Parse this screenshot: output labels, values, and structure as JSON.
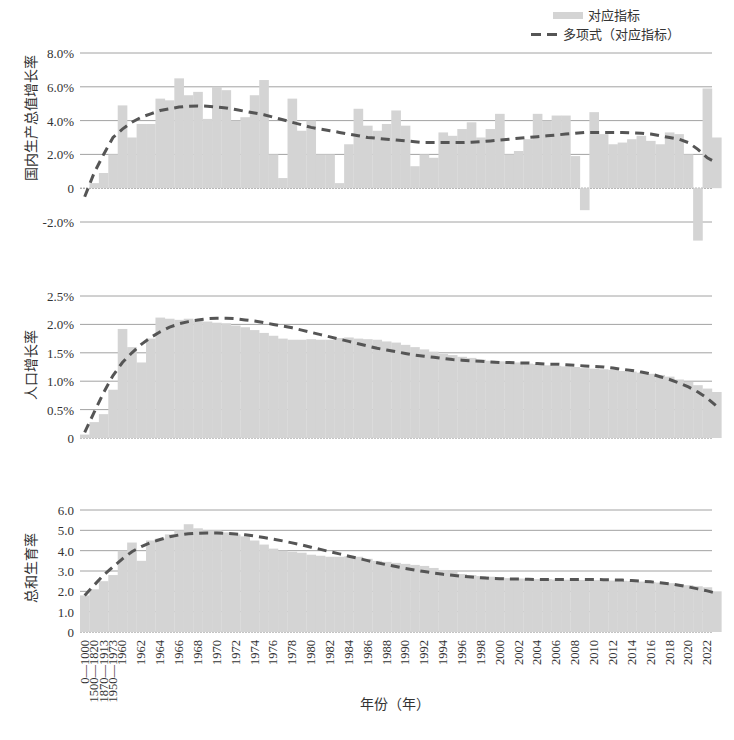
{
  "legend": {
    "bar_label": "对应指标",
    "trend_label": "多项式（对应指标）"
  },
  "x_axis": {
    "title": "年份（年）",
    "tick_labels": [
      "0—1000",
      "1500—1820",
      "1870—1913",
      "1950—1973",
      "1960",
      "1962",
      "1964",
      "1966",
      "1968",
      "1970",
      "1972",
      "1974",
      "1976",
      "1978",
      "1980",
      "1982",
      "1984",
      "1986",
      "1988",
      "1990",
      "1992",
      "1994",
      "1996",
      "1998",
      "2000",
      "2002",
      "2004",
      "2006",
      "2008",
      "2010",
      "2012",
      "2014",
      "2016",
      "2018",
      "2020",
      "2022"
    ]
  },
  "colors": {
    "bar": "#d4d4d4",
    "trend": "#555555",
    "grid": "#8a8a8a",
    "text": "#333333"
  },
  "chart_data": [
    {
      "type": "bar",
      "title": "",
      "ylabel": "国内生产总值增长率",
      "xlabel": "年份（年）",
      "ylim": [
        -2.0,
        8.0
      ],
      "yticks": [
        -2.0,
        0,
        2.0,
        4.0,
        6.0,
        8.0
      ],
      "ytick_labels": [
        "-2.0%",
        "0",
        "2.0%",
        "4.0%",
        "6.0%",
        "8.0%"
      ],
      "grid": true,
      "legend_position": "top-right",
      "categories": [
        "0—1000",
        "1500—1820",
        "1870—1913",
        "1950—1973",
        "1960",
        "1961",
        "1962",
        "1963",
        "1964",
        "1965",
        "1966",
        "1967",
        "1968",
        "1969",
        "1970",
        "1971",
        "1972",
        "1973",
        "1974",
        "1975",
        "1976",
        "1977",
        "1978",
        "1979",
        "1980",
        "1981",
        "1982",
        "1983",
        "1984",
        "1985",
        "1986",
        "1987",
        "1988",
        "1989",
        "1990",
        "1991",
        "1992",
        "1993",
        "1994",
        "1995",
        "1996",
        "1997",
        "1998",
        "1999",
        "2000",
        "2001",
        "2002",
        "2003",
        "2004",
        "2005",
        "2006",
        "2007",
        "2008",
        "2009",
        "2010",
        "2011",
        "2012",
        "2013",
        "2014",
        "2015",
        "2016",
        "2017",
        "2018",
        "2019",
        "2020",
        "2021",
        "2022"
      ],
      "series": [
        {
          "name": "对应指标",
          "values": [
            0.0,
            0.3,
            0.9,
            2.0,
            4.9,
            3.0,
            3.8,
            3.8,
            5.3,
            5.2,
            6.5,
            5.5,
            5.7,
            4.1,
            6.0,
            5.8,
            4.0,
            4.2,
            5.5,
            6.4,
            2.0,
            0.6,
            5.3,
            3.4,
            4.0,
            2.0,
            2.0,
            0.3,
            2.6,
            4.7,
            3.7,
            3.4,
            3.8,
            4.6,
            3.7,
            1.3,
            2.0,
            1.8,
            3.3,
            3.1,
            3.5,
            3.9,
            3.0,
            3.5,
            4.4,
            2.0,
            2.2,
            2.9,
            4.4,
            4.0,
            4.3,
            4.3,
            1.9,
            -1.3,
            4.5,
            3.2,
            2.6,
            2.7,
            2.9,
            3.1,
            2.8,
            2.6,
            3.3,
            3.2,
            2.0,
            -3.1,
            5.9,
            3.0
          ]
        },
        {
          "name": "多项式（对应指标）",
          "style": "dashed",
          "values": [
            -0.5,
            0.9,
            2.0,
            3.0,
            3.5,
            3.9,
            4.2,
            4.4,
            4.6,
            4.7,
            4.8,
            4.85,
            4.87,
            4.85,
            4.8,
            4.75,
            4.65,
            4.55,
            4.45,
            4.35,
            4.2,
            4.05,
            3.9,
            3.75,
            3.6,
            3.5,
            3.4,
            3.3,
            3.2,
            3.1,
            3.0,
            2.95,
            2.9,
            2.85,
            2.8,
            2.75,
            2.7,
            2.7,
            2.7,
            2.7,
            2.7,
            2.72,
            2.75,
            2.8,
            2.85,
            2.9,
            2.95,
            3.0,
            3.05,
            3.1,
            3.15,
            3.2,
            3.25,
            3.3,
            3.3,
            3.3,
            3.3,
            3.3,
            3.28,
            3.25,
            3.2,
            3.1,
            3.0,
            2.9,
            2.7,
            2.3,
            1.8,
            1.5
          ]
        }
      ]
    },
    {
      "type": "bar",
      "title": "",
      "ylabel": "人口增长率",
      "xlabel": "年份（年）",
      "ylim": [
        0,
        2.5
      ],
      "yticks": [
        0,
        0.5,
        1.0,
        1.5,
        2.0,
        2.5
      ],
      "ytick_labels": [
        "0",
        "0.5%",
        "1.0%",
        "1.5%",
        "2.0%",
        "2.5%"
      ],
      "grid": true,
      "categories_ref": "same as panel 1",
      "series": [
        {
          "name": "对应指标",
          "values": [
            0.06,
            0.28,
            0.42,
            0.85,
            1.92,
            1.6,
            1.33,
            1.75,
            2.12,
            2.1,
            2.08,
            2.1,
            2.07,
            2.05,
            2.03,
            2.02,
            1.98,
            1.95,
            1.9,
            1.85,
            1.8,
            1.75,
            1.73,
            1.73,
            1.74,
            1.73,
            1.73,
            1.76,
            1.77,
            1.75,
            1.74,
            1.73,
            1.7,
            1.68,
            1.64,
            1.6,
            1.56,
            1.52,
            1.48,
            1.46,
            1.43,
            1.41,
            1.38,
            1.36,
            1.35,
            1.34,
            1.33,
            1.31,
            1.3,
            1.28,
            1.27,
            1.26,
            1.25,
            1.23,
            1.22,
            1.21,
            1.2,
            1.18,
            1.17,
            1.15,
            1.13,
            1.11,
            1.08,
            1.03,
            0.99,
            0.93,
            0.87,
            0.81
          ]
        },
        {
          "name": "多项式（对应指标）",
          "style": "dashed",
          "values": [
            0.1,
            0.45,
            0.8,
            1.1,
            1.33,
            1.5,
            1.65,
            1.77,
            1.87,
            1.95,
            2.01,
            2.05,
            2.08,
            2.1,
            2.11,
            2.11,
            2.1,
            2.08,
            2.06,
            2.03,
            2.0,
            1.97,
            1.94,
            1.9,
            1.86,
            1.82,
            1.78,
            1.74,
            1.7,
            1.66,
            1.62,
            1.58,
            1.55,
            1.52,
            1.49,
            1.46,
            1.44,
            1.42,
            1.4,
            1.38,
            1.37,
            1.36,
            1.35,
            1.34,
            1.33,
            1.33,
            1.32,
            1.32,
            1.31,
            1.3,
            1.3,
            1.29,
            1.28,
            1.27,
            1.26,
            1.25,
            1.23,
            1.21,
            1.19,
            1.16,
            1.13,
            1.08,
            1.03,
            0.97,
            0.9,
            0.81,
            0.7,
            0.56
          ]
        }
      ]
    },
    {
      "type": "bar",
      "title": "",
      "ylabel": "总和生育率",
      "xlabel": "年份（年）",
      "ylim": [
        0,
        6.0
      ],
      "yticks": [
        0,
        1.0,
        2.0,
        3.0,
        4.0,
        5.0,
        6.0
      ],
      "ytick_labels": [
        "0",
        "1.0",
        "2.0",
        "3.0",
        "4.0",
        "5.0",
        "6.0"
      ],
      "grid": true,
      "categories_ref": "same as panel 1",
      "series": [
        {
          "name": "对应指标",
          "values": [
            1.8,
            2.1,
            2.5,
            2.8,
            4.0,
            4.4,
            3.5,
            4.5,
            4.6,
            4.8,
            5.0,
            5.3,
            5.1,
            5.0,
            5.0,
            4.9,
            4.8,
            4.7,
            4.5,
            4.3,
            4.1,
            4.0,
            3.95,
            3.9,
            3.8,
            3.75,
            3.7,
            3.7,
            3.72,
            3.7,
            3.6,
            3.5,
            3.45,
            3.4,
            3.35,
            3.3,
            3.25,
            3.15,
            3.05,
            2.95,
            2.85,
            2.8,
            2.75,
            2.72,
            2.68,
            2.65,
            2.63,
            2.62,
            2.6,
            2.6,
            2.58,
            2.57,
            2.56,
            2.56,
            2.55,
            2.54,
            2.53,
            2.52,
            2.5,
            2.48,
            2.46,
            2.43,
            2.4,
            2.35,
            2.3,
            2.25,
            2.2,
            2.0
          ]
        },
        {
          "name": "多项式（对应指标）",
          "style": "dashed",
          "values": [
            1.8,
            2.3,
            2.8,
            3.2,
            3.6,
            3.95,
            4.2,
            4.4,
            4.55,
            4.68,
            4.77,
            4.83,
            4.86,
            4.87,
            4.87,
            4.85,
            4.82,
            4.78,
            4.72,
            4.65,
            4.57,
            4.48,
            4.38,
            4.28,
            4.17,
            4.06,
            3.95,
            3.84,
            3.73,
            3.62,
            3.51,
            3.41,
            3.31,
            3.22,
            3.13,
            3.05,
            2.97,
            2.9,
            2.84,
            2.79,
            2.74,
            2.7,
            2.67,
            2.64,
            2.62,
            2.61,
            2.6,
            2.59,
            2.58,
            2.58,
            2.58,
            2.58,
            2.58,
            2.58,
            2.58,
            2.57,
            2.56,
            2.55,
            2.53,
            2.5,
            2.47,
            2.42,
            2.37,
            2.3,
            2.22,
            2.12,
            2.02,
            1.9
          ]
        }
      ]
    }
  ]
}
